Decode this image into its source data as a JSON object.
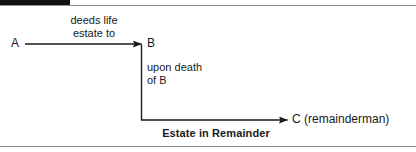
{
  "figure": {
    "type": "legal-estate-flow-diagram",
    "background_color": "#ffffff",
    "line_color": "#1a1a1a",
    "rule_color": "#8d8d8d",
    "bar_color": "#111111",
    "width": 416,
    "height": 152
  },
  "nodes": {
    "a": "A",
    "b": "B",
    "c": "C (remainderman)"
  },
  "captions": {
    "deeds": "deeds life\nestate to",
    "upon_death": "upon death\nof B",
    "estate_in_remainder": "Estate in Remainder"
  },
  "arrows": {
    "a_to_b": {
      "label": "deeds life estate to",
      "from": "A",
      "to": "B",
      "direction": "right"
    },
    "b_to_c": {
      "label": "upon death of B",
      "from": "B",
      "to": "C (remainderman)",
      "direction": "down-then-right"
    }
  }
}
